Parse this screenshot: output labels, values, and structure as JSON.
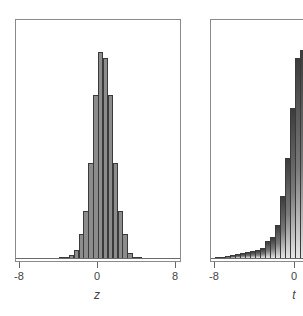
{
  "chart_data": [
    {
      "type": "bar",
      "title": "",
      "xlabel": "z",
      "ylabel": "",
      "xlim": [
        -8,
        8
      ],
      "xticks": [
        "-8",
        "0",
        "8"
      ],
      "grid": false,
      "legend": null,
      "bin_width": 0.5,
      "bins": [
        {
          "x0": -4.0,
          "h": 0.3
        },
        {
          "x0": -3.5,
          "h": 0.6
        },
        {
          "x0": -3.0,
          "h": 1.5
        },
        {
          "x0": -2.5,
          "h": 4.0
        },
        {
          "x0": -2.0,
          "h": 11.5
        },
        {
          "x0": -1.5,
          "h": 23.0
        },
        {
          "x0": -1.0,
          "h": 46.0
        },
        {
          "x0": -0.5,
          "h": 79.0
        },
        {
          "x0": 0.0,
          "h": 100.0
        },
        {
          "x0": 0.5,
          "h": 97.0
        },
        {
          "x0": 1.0,
          "h": 79.0
        },
        {
          "x0": 1.5,
          "h": 46.0
        },
        {
          "x0": 2.0,
          "h": 23.0
        },
        {
          "x0": 2.5,
          "h": 11.5
        },
        {
          "x0": 3.0,
          "h": 2.2
        },
        {
          "x0": 3.5,
          "h": 0.6
        },
        {
          "x0": 4.0,
          "h": 0.2
        }
      ]
    },
    {
      "type": "bar",
      "title": "",
      "xlabel": "t",
      "ylabel": "",
      "xlim": [
        -8,
        8
      ],
      "xticks": [
        "-8",
        "0"
      ],
      "grid": false,
      "legend": null,
      "bin_width": 0.5,
      "bins": [
        {
          "x0": -8.0,
          "h": 0.5
        },
        {
          "x0": -7.5,
          "h": 0.7
        },
        {
          "x0": -7.0,
          "h": 1.0
        },
        {
          "x0": -6.5,
          "h": 1.3
        },
        {
          "x0": -6.0,
          "h": 1.7
        },
        {
          "x0": -5.5,
          "h": 2.2
        },
        {
          "x0": -5.0,
          "h": 2.7
        },
        {
          "x0": -4.5,
          "h": 3.3
        },
        {
          "x0": -4.0,
          "h": 4.0
        },
        {
          "x0": -3.5,
          "h": 5.0
        },
        {
          "x0": -3.0,
          "h": 8.0
        },
        {
          "x0": -2.5,
          "h": 10.0
        },
        {
          "x0": -2.0,
          "h": 16.0
        },
        {
          "x0": -1.5,
          "h": 30.0
        },
        {
          "x0": -1.0,
          "h": 48.0
        },
        {
          "x0": -0.5,
          "h": 72.0
        },
        {
          "x0": 0.0,
          "h": 96.0
        },
        {
          "x0": 0.5,
          "h": 100.0
        },
        {
          "x0": 1.0,
          "h": 74.0
        }
      ]
    }
  ]
}
